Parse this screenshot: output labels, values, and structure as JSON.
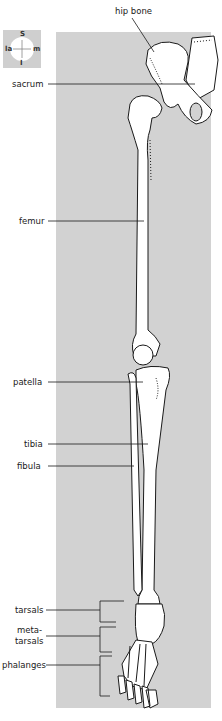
{
  "diagram": {
    "compass": {
      "top": "S",
      "bottom": "I",
      "left": "la",
      "right": "m"
    },
    "labels": [
      {
        "id": "hip-bone",
        "text": "hip bone"
      },
      {
        "id": "sacrum",
        "text": "sacrum"
      },
      {
        "id": "femur",
        "text": "femur"
      },
      {
        "id": "patella",
        "text": "patella"
      },
      {
        "id": "tibia",
        "text": "tibia"
      },
      {
        "id": "fibula",
        "text": "fibula"
      },
      {
        "id": "tarsals",
        "text": "tarsals"
      },
      {
        "id": "metatarsals-1",
        "text": "meta-"
      },
      {
        "id": "metatarsals-2",
        "text": "tarsals"
      },
      {
        "id": "phalanges",
        "text": "phalanges"
      }
    ],
    "colors": {
      "panel": "#d2d2d2",
      "bone": "#ffffff",
      "outline": "#1a1a1a"
    }
  }
}
